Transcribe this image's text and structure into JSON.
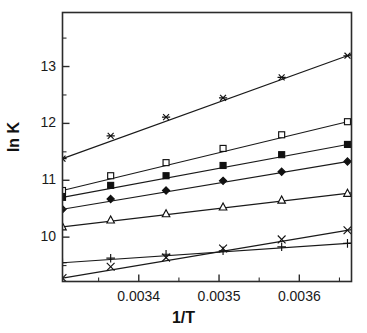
{
  "chart_data": {
    "type": "line",
    "title": "",
    "subtitle": "",
    "xlabel": "1/T",
    "ylabel": "ln K",
    "xlim": [
      0.003305,
      0.003665
    ],
    "ylim": [
      9.22,
      13.95
    ],
    "grid": false,
    "legend": "none",
    "x_ticks_major": [
      0.0034,
      0.0035,
      0.0036
    ],
    "x_ticklabels": [
      "0.0034",
      "0.0035",
      "0.0036"
    ],
    "x_ticks_minor": [
      0.00335,
      0.00345,
      0.00355,
      0.00365
    ],
    "y_ticks_major": [
      10,
      11,
      12,
      13
    ],
    "y_ticklabels": [
      "10",
      "11",
      "12",
      "13"
    ],
    "y_ticks_minor": [
      9.5,
      10.5,
      11.5,
      12.5,
      13.5
    ],
    "series": [
      {
        "name": "series-1",
        "marker": "asterisk",
        "fill": "open",
        "x": [
          0.003305,
          0.003365,
          0.003434,
          0.003505,
          0.003578,
          0.00366
        ],
        "y": [
          11.38,
          11.78,
          12.11,
          12.45,
          12.81,
          13.19
        ],
        "values": [
          11.38,
          11.78,
          12.11,
          12.45,
          12.81,
          13.19
        ]
      },
      {
        "name": "series-2",
        "marker": "square",
        "fill": "open",
        "x": [
          0.003305,
          0.003365,
          0.003434,
          0.003505,
          0.003578,
          0.00366
        ],
        "y": [
          10.82,
          11.08,
          11.31,
          11.56,
          11.8,
          12.03
        ],
        "values": [
          10.82,
          11.08,
          11.31,
          11.56,
          11.8,
          12.03
        ]
      },
      {
        "name": "series-3",
        "marker": "square",
        "fill": "filled",
        "x": [
          0.003305,
          0.003365,
          0.003434,
          0.003505,
          0.003578,
          0.00366
        ],
        "y": [
          10.7,
          10.91,
          11.08,
          11.26,
          11.45,
          11.63
        ],
        "values": [
          10.7,
          10.91,
          11.08,
          11.26,
          11.45,
          11.63
        ]
      },
      {
        "name": "series-4",
        "marker": "diamond",
        "fill": "filled",
        "x": [
          0.003305,
          0.003365,
          0.003434,
          0.003505,
          0.003578,
          0.00366
        ],
        "y": [
          10.49,
          10.67,
          10.82,
          10.99,
          11.15,
          11.33
        ],
        "values": [
          10.49,
          10.67,
          10.82,
          10.99,
          11.15,
          11.33
        ]
      },
      {
        "name": "series-5",
        "marker": "triangle",
        "fill": "open",
        "x": [
          0.003305,
          0.003365,
          0.003434,
          0.003505,
          0.003578,
          0.00366
        ],
        "y": [
          10.18,
          10.3,
          10.41,
          10.53,
          10.65,
          10.77
        ],
        "values": [
          10.18,
          10.3,
          10.41,
          10.53,
          10.65,
          10.77
        ]
      },
      {
        "name": "series-6",
        "marker": "cross-x",
        "fill": "open",
        "x": [
          0.003305,
          0.003365,
          0.003434,
          0.003505,
          0.003578,
          0.00366
        ],
        "y": [
          9.28,
          9.48,
          9.64,
          9.8,
          9.96,
          10.12
        ],
        "values": [
          9.28,
          9.48,
          9.64,
          9.8,
          9.96,
          10.12
        ]
      },
      {
        "name": "series-7",
        "marker": "plus",
        "fill": "open",
        "x": [
          0.003305,
          0.003365,
          0.003434,
          0.003505,
          0.003578,
          0.00366
        ],
        "y": [
          9.55,
          9.63,
          9.7,
          9.76,
          9.83,
          9.89
        ],
        "values": [
          9.55,
          9.63,
          9.7,
          9.76,
          9.83,
          9.89
        ]
      }
    ],
    "colors": {
      "line": "#1a1a1a",
      "axis": "#2b2b2b",
      "background": "#ffffff"
    }
  }
}
